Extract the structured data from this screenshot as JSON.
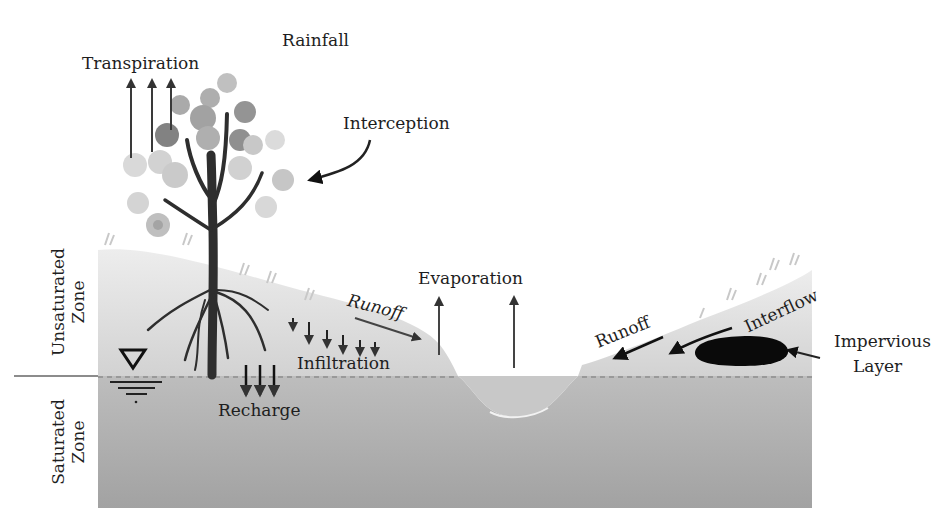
{
  "diagram": {
    "labels": {
      "rainfall": "Rainfall",
      "transpiration": "Transpiration",
      "interception": "Interception",
      "evaporation": "Evaporation",
      "runoff_left": "Runoff",
      "runoff_right": "Runoff",
      "interflow": "Interflow",
      "infiltration": "Infiltration",
      "recharge": "Recharge",
      "impervious_layer_line1": "Impervious",
      "impervious_layer_line2": "Layer",
      "unsaturated_zone_line1": "Unsaturated",
      "unsaturated_zone_line2": "Zone",
      "saturated_zone_line1": "Saturated",
      "saturated_zone_line2": "Zone"
    },
    "icons": {
      "water_table": "water-table-triangle-icon",
      "tree": "tree-icon",
      "impervious_layer": "impervious-layer-blob"
    },
    "colors": {
      "sky": "#ffffff",
      "unsaturated": "#d9d9d9",
      "saturated": "#a9a9a9",
      "stream": "#c4c4c4",
      "text": "#1e1e1e",
      "arrow": "#3a3a3a",
      "tree": "#2e2e2e",
      "impervious": "#0a0a0a"
    }
  }
}
